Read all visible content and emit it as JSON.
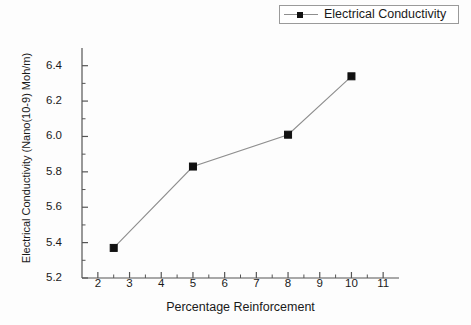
{
  "chart_data": {
    "type": "line",
    "title": "",
    "xlabel": "Percentage Reinforcement",
    "ylabel": "Electrical Conductivity (Nano(10-9) Moh/m)",
    "x": [
      2.5,
      5,
      8,
      10
    ],
    "values": [
      5.37,
      5.83,
      6.01,
      6.34
    ],
    "series": [
      {
        "name": "Electrical Conductivity",
        "x": [
          2.5,
          5,
          8,
          10
        ],
        "values": [
          5.37,
          5.83,
          6.01,
          6.34
        ]
      }
    ],
    "xlim": [
      1.5,
      11.5
    ],
    "ylim": [
      5.2,
      6.5
    ],
    "xticks": [
      2,
      3,
      4,
      5,
      6,
      7,
      8,
      9,
      10,
      11
    ],
    "xtick_labels": [
      "2",
      "3",
      "4",
      "5",
      "6",
      "7",
      "8",
      "9",
      "10",
      "11"
    ],
    "yticks": [
      5.2,
      5.4,
      5.6,
      5.8,
      6.0,
      6.2,
      6.4
    ],
    "ytick_labels": [
      "5.2",
      "5.4",
      "5.6",
      "5.8",
      "6.0",
      "6.2",
      "6.4"
    ],
    "grid": false,
    "legend_position": "top-right",
    "marker": "square",
    "line_color": "#8e8e8e",
    "marker_color": "#111111",
    "axis_color": "#555555",
    "background_color": "#fdfdfd"
  },
  "legend": {
    "entries": [
      {
        "label": "Electrical Conductivity"
      }
    ]
  }
}
